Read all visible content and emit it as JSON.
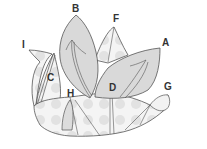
{
  "diagram": {
    "type": "folded paper flower (lotus) illustration",
    "colors": {
      "stroke": "#555555",
      "petal_fill": "#d9d9d9",
      "base_fill": "#f2f2f2",
      "dot_fill": "#e0e0e0",
      "label": "#333333"
    },
    "labels": [
      {
        "id": "A",
        "text": "A",
        "x": 162,
        "y": 38
      },
      {
        "id": "B",
        "text": "B",
        "x": 72,
        "y": 4
      },
      {
        "id": "C",
        "text": "C",
        "x": 47,
        "y": 73
      },
      {
        "id": "D",
        "text": "D",
        "x": 109,
        "y": 83
      },
      {
        "id": "F",
        "text": "F",
        "x": 113,
        "y": 14
      },
      {
        "id": "G",
        "text": "G",
        "x": 164,
        "y": 82
      },
      {
        "id": "H",
        "text": "H",
        "x": 67,
        "y": 89
      },
      {
        "id": "I",
        "text": "I",
        "x": 22,
        "y": 40
      }
    ]
  }
}
